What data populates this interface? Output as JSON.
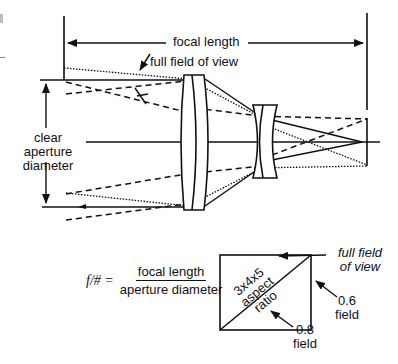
{
  "diagram": {
    "labels": {
      "focal_length": "focal length",
      "full_field_of_view": "full field of view",
      "clear_aperture_line1": "clear",
      "clear_aperture_line2": "aperture",
      "clear_aperture_line3": "diameter"
    },
    "formula": {
      "lhs": "f/# =",
      "numerator": "focal length",
      "denominator": "aperture diameter"
    },
    "aspect_box": {
      "line1": "3x4x5",
      "line2": "aspect",
      "line3": "ratio",
      "full_fov_line1": "full field",
      "full_fov_line2": "of view",
      "field_06_line1": "0.6",
      "field_06_line2": "field",
      "field_08_line1": "0.8",
      "field_08_line2": "field"
    },
    "colors": {
      "ink": "#111111",
      "background": "#ffffff"
    }
  }
}
